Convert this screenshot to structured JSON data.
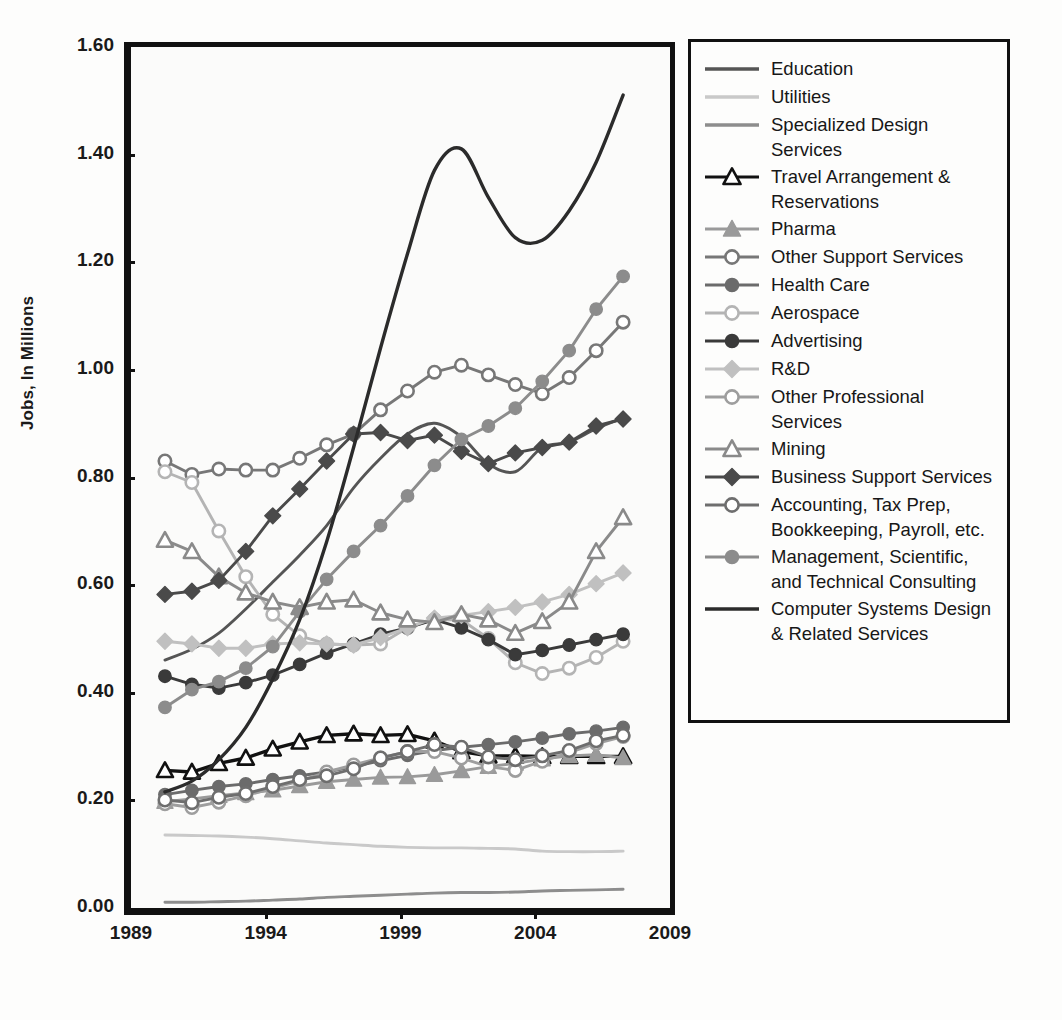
{
  "chart": {
    "type": "line",
    "ylabel": "Jobs, In Millions",
    "xlabel": "",
    "yticks": [
      "0.00",
      "0.20",
      "0.40",
      "0.60",
      "0.80",
      "1.00",
      "1.20",
      "1.40",
      "1.60"
    ],
    "xticks": [
      "1989",
      "1994",
      "1999",
      "2004",
      "2009"
    ],
    "ylim": [
      0,
      1.6
    ],
    "xlim": [
      1989,
      2009
    ],
    "grid": false,
    "legend_position": "right"
  },
  "chart_data": {
    "type": "line",
    "title": "",
    "xlabel": "",
    "ylabel": "Jobs, In Millions",
    "ylim": [
      0,
      1.6
    ],
    "xlim": [
      1989,
      2009
    ],
    "x": [
      1990,
      1991,
      1992,
      1993,
      1994,
      1995,
      1996,
      1997,
      1998,
      1999,
      2000,
      2001,
      2002,
      2003,
      2004,
      2005,
      2006,
      2007
    ],
    "series": [
      {
        "name": "Education",
        "marker": "none",
        "color": "#555555",
        "values": [
          0.47,
          0.49,
          0.52,
          0.565,
          0.615,
          0.665,
          0.72,
          0.79,
          0.845,
          0.89,
          0.91,
          0.885,
          0.835,
          0.82,
          0.865,
          0.875,
          0.9,
          0.92
        ]
      },
      {
        "name": "Utilities",
        "marker": "none",
        "color": "#c9c9c9",
        "values": [
          0.145,
          0.144,
          0.143,
          0.141,
          0.138,
          0.134,
          0.13,
          0.127,
          0.124,
          0.122,
          0.121,
          0.121,
          0.12,
          0.119,
          0.115,
          0.114,
          0.114,
          0.115
        ]
      },
      {
        "name": "Specialized Design Services",
        "marker": "none",
        "color": "#8d8d8d",
        "values": [
          0.02,
          0.02,
          0.021,
          0.022,
          0.024,
          0.026,
          0.029,
          0.031,
          0.033,
          0.035,
          0.037,
          0.038,
          0.038,
          0.039,
          0.041,
          0.042,
          0.043,
          0.044
        ]
      },
      {
        "name": "Travel Arrangement & Reservations",
        "marker": "triangle-open",
        "color": "#111111",
        "values": [
          0.265,
          0.262,
          0.278,
          0.288,
          0.305,
          0.318,
          0.33,
          0.333,
          0.33,
          0.332,
          0.32,
          0.3,
          0.292,
          0.292,
          0.291,
          0.291,
          0.291,
          0.291
        ]
      },
      {
        "name": "Pharma",
        "marker": "triangle-filled",
        "color": "#9a9a9a",
        "values": [
          0.207,
          0.212,
          0.218,
          0.223,
          0.228,
          0.236,
          0.244,
          0.248,
          0.252,
          0.253,
          0.257,
          0.264,
          0.272,
          0.278,
          0.286,
          0.292,
          0.294,
          0.288
        ]
      },
      {
        "name": "Other Support Services",
        "marker": "circle-open",
        "color": "#777777",
        "values": [
          0.84,
          0.815,
          0.825,
          0.823,
          0.823,
          0.845,
          0.87,
          0.89,
          0.935,
          0.97,
          1.005,
          1.018,
          1.0,
          0.982,
          0.965,
          0.995,
          1.045,
          1.098
        ]
      },
      {
        "name": "Health Care",
        "marker": "circle-filled",
        "color": "#6b6b6b",
        "values": [
          0.22,
          0.228,
          0.235,
          0.24,
          0.248,
          0.255,
          0.262,
          0.272,
          0.283,
          0.293,
          0.302,
          0.308,
          0.313,
          0.318,
          0.325,
          0.333,
          0.338,
          0.345
        ]
      },
      {
        "name": "Aerospace",
        "marker": "circle-open",
        "color": "#b4b4b4",
        "values": [
          0.82,
          0.8,
          0.71,
          0.625,
          0.555,
          0.515,
          0.5,
          0.498,
          0.5,
          0.53,
          0.545,
          0.545,
          0.51,
          0.465,
          0.445,
          0.455,
          0.475,
          0.505
        ]
      },
      {
        "name": "Advertising",
        "marker": "circle-filled",
        "color": "#3a3a3a",
        "values": [
          0.44,
          0.425,
          0.418,
          0.428,
          0.442,
          0.462,
          0.483,
          0.5,
          0.518,
          0.53,
          0.545,
          0.53,
          0.508,
          0.48,
          0.488,
          0.498,
          0.508,
          0.518
        ]
      },
      {
        "name": "R&D",
        "marker": "diamond",
        "color": "#c0c0c0",
        "values": [
          0.505,
          0.5,
          0.492,
          0.492,
          0.5,
          0.502,
          0.5,
          0.498,
          0.512,
          0.53,
          0.548,
          0.553,
          0.56,
          0.568,
          0.578,
          0.592,
          0.612,
          0.632
        ]
      },
      {
        "name": "Other Professional Services",
        "marker": "circle-open",
        "color": "#9e9e9e",
        "values": [
          0.203,
          0.196,
          0.206,
          0.218,
          0.232,
          0.245,
          0.262,
          0.275,
          0.288,
          0.3,
          0.3,
          0.288,
          0.272,
          0.265,
          0.282,
          0.298,
          0.315,
          0.328
        ]
      },
      {
        "name": "Mining",
        "marker": "triangle-open",
        "color": "#8a8a8a",
        "values": [
          0.693,
          0.672,
          0.625,
          0.595,
          0.578,
          0.568,
          0.578,
          0.582,
          0.558,
          0.545,
          0.54,
          0.555,
          0.545,
          0.52,
          0.542,
          0.578,
          0.672,
          0.735
        ]
      },
      {
        "name": "Business Support Services",
        "marker": "diamond",
        "color": "#4a4a4a",
        "values": [
          0.592,
          0.598,
          0.618,
          0.672,
          0.738,
          0.788,
          0.84,
          0.89,
          0.893,
          0.878,
          0.888,
          0.858,
          0.835,
          0.855,
          0.865,
          0.875,
          0.905,
          0.918
        ]
      },
      {
        "name": "Accounting, Tax Prep, Bookkeeping, Payroll, etc.",
        "marker": "circle-open",
        "color": "#6e6e6e",
        "values": [
          0.21,
          0.205,
          0.215,
          0.222,
          0.235,
          0.248,
          0.255,
          0.268,
          0.288,
          0.3,
          0.313,
          0.308,
          0.29,
          0.285,
          0.292,
          0.302,
          0.32,
          0.33
        ]
      },
      {
        "name": "Management, Scientific, and Technical Consulting",
        "marker": "circle-filled",
        "color": "#8c8c8c",
        "values": [
          0.382,
          0.415,
          0.43,
          0.455,
          0.495,
          0.56,
          0.62,
          0.672,
          0.72,
          0.775,
          0.832,
          0.88,
          0.905,
          0.938,
          0.988,
          1.045,
          1.122,
          1.183
        ]
      },
      {
        "name": "Computer Systems Design & Related Services",
        "marker": "none",
        "color": "#2b2b2b",
        "values": [
          0.225,
          0.245,
          0.285,
          0.345,
          0.435,
          0.545,
          0.69,
          0.865,
          1.05,
          1.225,
          1.38,
          1.42,
          1.33,
          1.255,
          1.25,
          1.305,
          1.395,
          1.52
        ]
      }
    ]
  },
  "legend": {
    "items": [
      {
        "label": "Education",
        "marker": "none",
        "color": "#555555",
        "lines": 1
      },
      {
        "label": "Utilities",
        "marker": "none",
        "color": "#c9c9c9",
        "lines": 1
      },
      {
        "label": "Specialized Design Services",
        "marker": "none",
        "color": "#8d8d8d",
        "lines": 1
      },
      {
        "label": "Travel Arrangement & Reservations",
        "marker": "triangle-open",
        "color": "#111111",
        "lines": 2
      },
      {
        "label": "Pharma",
        "marker": "triangle-filled",
        "color": "#9a9a9a",
        "lines": 1
      },
      {
        "label": "Other Support Services",
        "marker": "circle-open",
        "color": "#777777",
        "lines": 1
      },
      {
        "label": "Health Care",
        "marker": "circle-filled",
        "color": "#6b6b6b",
        "lines": 1
      },
      {
        "label": "Aerospace",
        "marker": "circle-open",
        "color": "#b4b4b4",
        "lines": 1
      },
      {
        "label": "Advertising",
        "marker": "circle-filled",
        "color": "#3a3a3a",
        "lines": 1
      },
      {
        "label": "R&D",
        "marker": "diamond",
        "color": "#c0c0c0",
        "lines": 1
      },
      {
        "label": "Other Professional Services",
        "marker": "circle-open",
        "color": "#9e9e9e",
        "lines": 1
      },
      {
        "label": "Mining",
        "marker": "triangle-open",
        "color": "#8a8a8a",
        "lines": 1
      },
      {
        "label": "Business Support Services",
        "marker": "diamond",
        "color": "#4a4a4a",
        "lines": 1
      },
      {
        "label": "Accounting, Tax Prep, Bookkeeping, Payroll, etc.",
        "marker": "circle-open",
        "color": "#6e6e6e",
        "lines": 2
      },
      {
        "label": "Management, Scientific, and Technical Consulting",
        "marker": "circle-filled",
        "color": "#8c8c8c",
        "lines": 3
      },
      {
        "label": "Computer Systems Design & Related Services",
        "marker": "none",
        "color": "#2b2b2b",
        "lines": 3
      }
    ]
  }
}
